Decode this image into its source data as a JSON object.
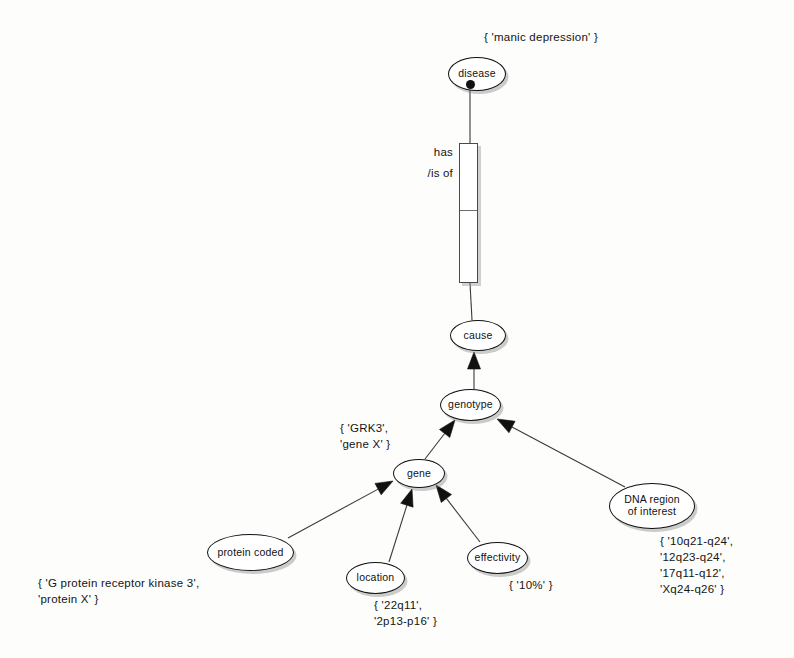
{
  "diagram": {
    "canvas": {
      "width": 794,
      "height": 658
    },
    "colors": {
      "node_stroke": "#111111",
      "node_fill": "#ffffff",
      "edge_stroke": "#3a3a3a",
      "text": "#141414",
      "shadow": "rgba(120,120,120,0.38)"
    }
  },
  "nodes": [
    {
      "id": "disease",
      "label": "disease",
      "x": 448,
      "y": 57,
      "w": 58,
      "h": 34,
      "font": 10.5
    },
    {
      "id": "cause",
      "label": "cause",
      "x": 450,
      "y": 320,
      "w": 56,
      "h": 31,
      "font": 10.5
    },
    {
      "id": "genotype",
      "label": "genotype",
      "x": 440,
      "y": 389,
      "w": 61,
      "h": 32,
      "font": 10.5
    },
    {
      "id": "gene",
      "label": "gene",
      "x": 393,
      "y": 459,
      "w": 52,
      "h": 29,
      "font": 10.5
    },
    {
      "id": "protein",
      "label": "protein coded",
      "x": 207,
      "y": 534,
      "w": 87,
      "h": 37,
      "font": 10.5
    },
    {
      "id": "location",
      "label": "location",
      "x": 346,
      "y": 562,
      "w": 59,
      "h": 32,
      "font": 10.5
    },
    {
      "id": "effectivity",
      "label": "effectivity",
      "x": 467,
      "y": 542,
      "w": 61,
      "h": 32,
      "font": 10.5
    },
    {
      "id": "dnaregion",
      "label": "DNA region\nof interest",
      "x": 609,
      "y": 483,
      "w": 86,
      "h": 46,
      "font": 10.5
    }
  ],
  "relationship_box": {
    "id": "has-is-of",
    "x": 459,
    "y": 143,
    "w": 19,
    "h": 140,
    "divider_offset": 66,
    "label": "has\n/is of",
    "label_x": 411,
    "label_y": 142,
    "label_w": 42
  },
  "connector_dot": {
    "x": 470,
    "y": 84
  },
  "value_sets": [
    {
      "id": "disease-values",
      "text": "{ 'manic depression' }",
      "x": 484,
      "y": 30,
      "align": "left"
    },
    {
      "id": "gene-values",
      "text": "{ 'GRK3',\n  'gene X' }",
      "x": 340,
      "y": 421,
      "align": "left"
    },
    {
      "id": "protein-values",
      "text": "{ 'G protein receptor kinase 3',\n  'protein X' }",
      "x": 38,
      "y": 576,
      "align": "left"
    },
    {
      "id": "location-values",
      "text": "{ '22q11',\n  '2p13-p16' }",
      "x": 374,
      "y": 598,
      "align": "left"
    },
    {
      "id": "effectivity-values",
      "text": "{ '10%' }",
      "x": 509,
      "y": 578,
      "align": "left"
    },
    {
      "id": "dnaregion-values",
      "text": "{ '10q21-q24',\n  '12q23-q24',\n  '17q11-q12',\n  'Xq24-q26' }",
      "x": 660,
      "y": 534,
      "align": "left"
    }
  ],
  "edges": [
    {
      "id": "disease-to-box",
      "from": "disease",
      "to": "has-is-of",
      "x1": 470,
      "y1": 88,
      "x2": 470,
      "y2": 143,
      "arrow": false
    },
    {
      "id": "box-to-cause",
      "from": "has-is-of",
      "to": "cause",
      "x1": 470,
      "y1": 283,
      "x2": 472,
      "y2": 320,
      "arrow": false
    },
    {
      "id": "genotype-to-cause",
      "from": "genotype",
      "to": "cause",
      "x1": 474,
      "y1": 389,
      "x2": 474,
      "y2": 352,
      "arrow": true
    },
    {
      "id": "gene-to-genotype",
      "from": "gene",
      "to": "genotype",
      "x1": 425,
      "y1": 459,
      "x2": 455,
      "y2": 420,
      "arrow": true
    },
    {
      "id": "dnaregion-to-genotype",
      "from": "dnaregion",
      "to": "genotype",
      "x1": 625,
      "y1": 487,
      "x2": 497,
      "y2": 419,
      "arrow": true
    },
    {
      "id": "protein-to-gene",
      "from": "protein",
      "to": "gene",
      "x1": 288,
      "y1": 538,
      "x2": 393,
      "y2": 481,
      "arrow": true
    },
    {
      "id": "location-to-gene",
      "from": "location",
      "to": "gene",
      "x1": 389,
      "y1": 562,
      "x2": 412,
      "y2": 489,
      "arrow": true
    },
    {
      "id": "effectivity-to-gene",
      "from": "effectivity",
      "to": "gene",
      "x1": 480,
      "y1": 542,
      "x2": 436,
      "y2": 485,
      "arrow": true
    }
  ]
}
